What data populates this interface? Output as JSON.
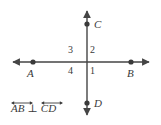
{
  "figure": {
    "line_color": "#454545",
    "text_color": "#3a3a3a",
    "background": "#ffffff"
  },
  "points": {
    "A": {
      "label": "A",
      "x": 33,
      "y": 62
    },
    "B": {
      "label": "B",
      "x": 131,
      "y": 62
    },
    "C": {
      "label": "C",
      "x": 87,
      "y": 24
    },
    "D": {
      "label": "D",
      "x": 87,
      "y": 103
    }
  },
  "lines": {
    "horizontal": {
      "name": "AB",
      "x1": 10,
      "x2": 152,
      "y": 62
    },
    "vertical": {
      "name": "CD",
      "y1": 8,
      "y2": 118,
      "x": 87
    }
  },
  "quadrants": {
    "upper_left": "3",
    "upper_right": "2",
    "lower_left": "4",
    "lower_right": "1"
  },
  "caption": {
    "first_term": "AB",
    "symbol": "⊥",
    "second_term": "CD",
    "full_text": "AB ⊥ CD"
  }
}
